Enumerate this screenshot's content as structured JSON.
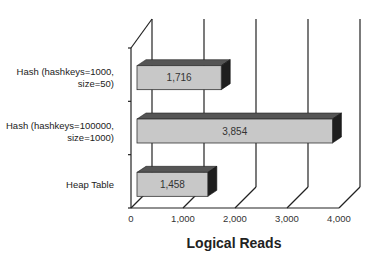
{
  "chart_data": {
    "type": "bar",
    "orientation": "horizontal",
    "style": "3d",
    "title": "",
    "xlabel": "Logical Reads",
    "ylabel": "",
    "categories": [
      "Hash (hashkeys=1000, size=50)",
      "Hash (hashkeys=100000, size=1000)",
      "Heap Table"
    ],
    "category_label_lines": [
      [
        "Hash  (hashkeys=1000,",
        "size=50)"
      ],
      [
        "Hash  (hashkeys=100000,",
        "size=1000)"
      ],
      [
        "Heap Table"
      ]
    ],
    "values": [
      1716,
      3854,
      1458
    ],
    "value_labels": [
      "1,716",
      "3,854",
      "1,458"
    ],
    "xlim": [
      0,
      4000
    ],
    "xticks": [
      0,
      1000,
      2000,
      3000,
      4000
    ],
    "xtick_labels": [
      "0",
      "1,000",
      "2,000",
      "3,000",
      "4,000"
    ],
    "grid": true,
    "legend": null,
    "colors": {
      "bar_front": "#c8c8c8",
      "bar_top": "#555555",
      "bar_side": "#1e1e1e",
      "axis": "#222222"
    }
  }
}
